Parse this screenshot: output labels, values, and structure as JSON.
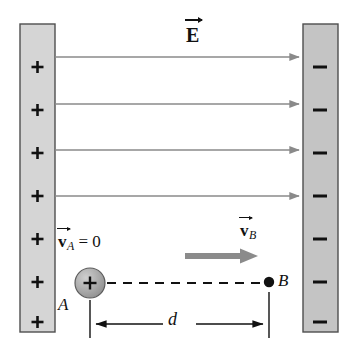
{
  "figure": {
    "name": "parallel-plate-capacitor-diagram",
    "width": 354,
    "height": 356,
    "background_color": "#ffffff"
  },
  "labels": {
    "field_label": "E",
    "velocity_a_symbol": "v",
    "velocity_a_subscript": "A",
    "velocity_a_equals": "= 0",
    "velocity_b_symbol": "v",
    "velocity_b_subscript": "B",
    "point_a": "A",
    "point_b": "B",
    "distance": "d"
  },
  "left_plate": {
    "charge_sign": "+",
    "charge_count": 7,
    "fill_color": "#d2d2d2",
    "border_color": "#555555",
    "x": 20,
    "y": 24,
    "width": 35,
    "height": 308
  },
  "right_plate": {
    "charge_sign": "–",
    "charge_count": 7,
    "fill_color": "#bfbfbf",
    "border_color": "#555555",
    "x": 303,
    "y": 24,
    "width": 35,
    "height": 308
  },
  "field_lines": {
    "count": 4,
    "color": "#8a8a8a",
    "y_positions": [
      57,
      104,
      150,
      196
    ],
    "x_start": 55,
    "x_end": 303
  },
  "charge_particle": {
    "label": "+",
    "center_x": 90,
    "center_y": 283,
    "radius": 15,
    "fill_color": "#a8a8a8",
    "edge_color": "#5a5a5a"
  },
  "trajectory": {
    "style": "dashed",
    "color": "#111111",
    "x_start": 106,
    "x_end": 268,
    "y": 283
  },
  "point_b_marker": {
    "x": 269,
    "y": 283,
    "radius": 5,
    "color": "#111111"
  },
  "velocity_arrow": {
    "color": "#888888",
    "x_start": 185,
    "x_end": 256,
    "y": 256,
    "thickness": 6
  },
  "dimension_line": {
    "y": 324,
    "x_start": 90,
    "x_end": 269,
    "color": "#111111",
    "extension_top": 300,
    "extension_bottom": 338
  },
  "colors": {
    "ink": "#111111",
    "field_gray": "#8a8a8a",
    "plate_fill": "#d2d2d2",
    "plate_edge": "#555555",
    "sphere_fill": "#a8a8a8",
    "velocity_arrow_gray": "#888888"
  }
}
